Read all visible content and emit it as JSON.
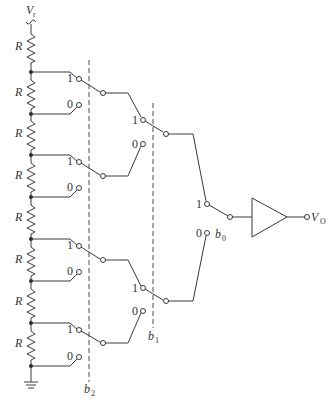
{
  "diagram": {
    "type": "3-bit resistor-string DAC with switch tree",
    "reference_label": "V",
    "reference_sub": "r",
    "resistor_label": "R",
    "resistor_count": 8,
    "switch_one_label": "1",
    "switch_zero_label": "0",
    "bits": [
      {
        "label": "b",
        "sub": "2"
      },
      {
        "label": "b",
        "sub": "1"
      },
      {
        "label": "b",
        "sub": "0"
      }
    ],
    "output_label": "V",
    "output_sub": "O",
    "buffer": "voltage follower (triangle amplifier)",
    "ground": "ground-symbol"
  }
}
